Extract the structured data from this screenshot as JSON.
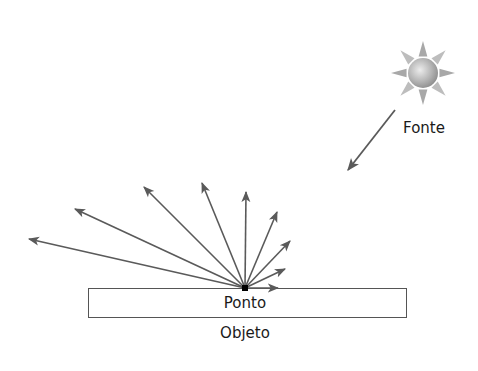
{
  "diagram": {
    "type": "diffuse-reflection",
    "colors": {
      "background": "#ffffff",
      "arrow": "#5a5a5a",
      "object_border": "#555555",
      "point": "#000000",
      "text": "#1a1a1a",
      "sun_light": "#e6e6e6",
      "sun_dark": "#8c8c8c"
    },
    "source": {
      "label": "Fonte",
      "icon": "sun-icon",
      "center": [
        423,
        73
      ]
    },
    "incident_ray": {
      "from": [
        395,
        110
      ],
      "to": [
        348,
        170
      ]
    },
    "reflection_point": {
      "label": "Ponto",
      "position": [
        245,
        288
      ]
    },
    "reflected_rays": [
      {
        "to": [
          29,
          239
        ]
      },
      {
        "to": [
          75,
          209
        ]
      },
      {
        "to": [
          144,
          187
        ]
      },
      {
        "to": [
          202,
          183
        ]
      },
      {
        "to": [
          246,
          192
        ]
      },
      {
        "to": [
          277,
          212
        ]
      },
      {
        "to": [
          290,
          241
        ]
      },
      {
        "to": [
          285,
          269
        ]
      },
      {
        "to": [
          278,
          288
        ]
      }
    ],
    "object": {
      "label": "Objeto",
      "rect": {
        "x": 88,
        "y": 288,
        "width": 318,
        "height": 29
      }
    }
  }
}
